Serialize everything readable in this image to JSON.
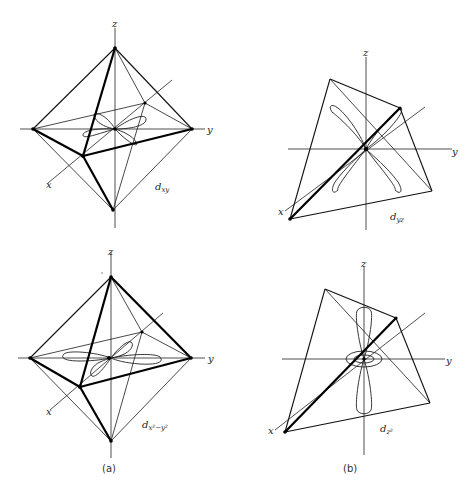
{
  "figure": {
    "panels": [
      {
        "id": "dxy",
        "orbital_label": "d",
        "orbital_sub": "xy",
        "axes": {
          "x": "x",
          "y": "y",
          "z": "z"
        },
        "shape": "octahedron"
      },
      {
        "id": "dyz",
        "orbital_label": "d",
        "orbital_sub": "yz",
        "axes": {
          "x": "x",
          "y": "y",
          "z": "z"
        },
        "shape": "tetrahedron"
      },
      {
        "id": "dx2y2",
        "orbital_label": "d",
        "orbital_sub": "x²−y²",
        "axes": {
          "x": "x",
          "y": "y",
          "z": "z"
        },
        "shape": "octahedron"
      },
      {
        "id": "dz2",
        "orbital_label": "d",
        "orbital_sub": "z²",
        "axes": {
          "x": "x",
          "y": "y",
          "z": "z"
        },
        "shape": "tetrahedron"
      }
    ],
    "captions": {
      "a": "(a)",
      "b": "(b)"
    },
    "colors": {
      "ink": "#000000",
      "background": "#ffffff"
    }
  }
}
